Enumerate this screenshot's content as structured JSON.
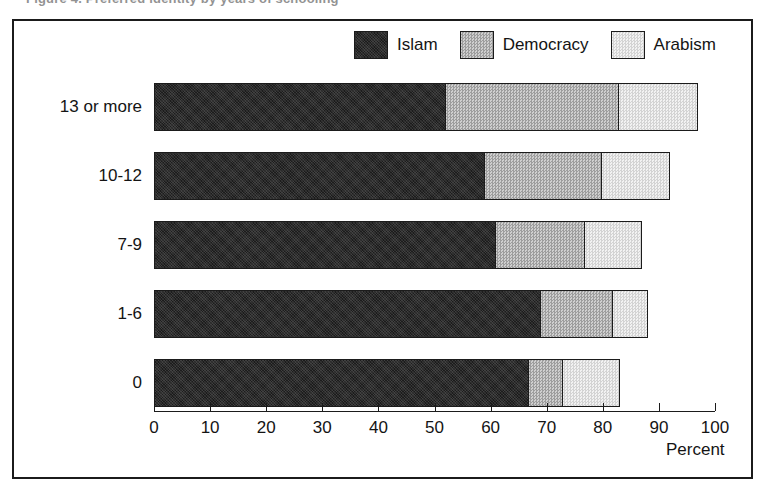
{
  "top_caption": "Figure 4.  Preferred identity by years of schooling",
  "chart_data": {
    "type": "bar",
    "orientation": "horizontal",
    "stacked": true,
    "title": "",
    "xlabel": "Percent",
    "ylabel": "",
    "xlim": [
      0,
      100
    ],
    "xticks": [
      0,
      10,
      20,
      30,
      40,
      50,
      60,
      70,
      80,
      90,
      100
    ],
    "xtick_labels": [
      "0",
      "10",
      "20",
      "30",
      "40",
      "50",
      "60",
      "70",
      "80",
      "90",
      "100"
    ],
    "grid": false,
    "legend_position": "top-right",
    "categories": [
      "13 or more",
      "10-12",
      "7-9",
      "1-6",
      "0"
    ],
    "series": [
      {
        "name": "Islam",
        "color": "#2b2b2b",
        "values": [
          52,
          59,
          61,
          69,
          67
        ]
      },
      {
        "name": "Democracy",
        "color": "#b7b7b7",
        "values": [
          31,
          21,
          16,
          13,
          6
        ]
      },
      {
        "name": "Arabism",
        "color": "#e2e2e2",
        "values": [
          14,
          12,
          10,
          6,
          10
        ]
      }
    ],
    "totals": [
      97,
      92,
      87,
      88,
      83
    ]
  },
  "legend": {
    "items": [
      {
        "label": "Islam",
        "swatch": "islam"
      },
      {
        "label": "Democracy",
        "swatch": "democracy"
      },
      {
        "label": "Arabism",
        "swatch": "arabism"
      }
    ]
  },
  "axis": {
    "title": "Percent"
  }
}
